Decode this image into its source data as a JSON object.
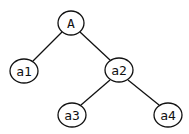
{
  "diagram": {
    "type": "tree",
    "nodes": [
      {
        "id": "A",
        "label": "A",
        "cx": 71,
        "cy": 23
      },
      {
        "id": "a1",
        "label": "a1",
        "cx": 24,
        "cy": 71
      },
      {
        "id": "a2",
        "label": "a2",
        "cx": 119,
        "cy": 70
      },
      {
        "id": "a3",
        "label": "a3",
        "cx": 72,
        "cy": 115
      },
      {
        "id": "a4",
        "label": "a4",
        "cx": 168,
        "cy": 115
      }
    ],
    "edges": [
      {
        "from": "A",
        "to": "a1"
      },
      {
        "from": "A",
        "to": "a2"
      },
      {
        "from": "a2",
        "to": "a3"
      },
      {
        "from": "a2",
        "to": "a4"
      }
    ]
  }
}
